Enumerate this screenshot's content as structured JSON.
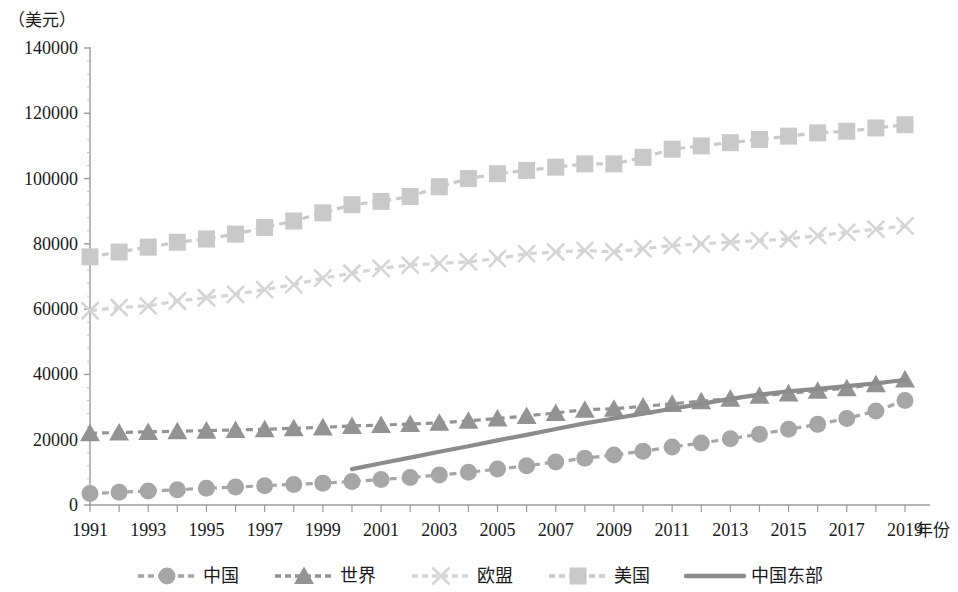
{
  "axis": {
    "y_unit_label": "（美元）",
    "x_axis_title": "年份",
    "y_ticks": [
      "0",
      "20000",
      "40000",
      "60000",
      "80000",
      "100000",
      "120000",
      "140000"
    ],
    "x_ticks": [
      "1991",
      "1993",
      "1995",
      "1997",
      "1999",
      "2001",
      "2003",
      "2005",
      "2007",
      "2009",
      "2011",
      "2013",
      "2015",
      "2017",
      "2019"
    ]
  },
  "legend": {
    "items": [
      {
        "label": "中国",
        "marker": "circle-marker",
        "color": "#a6a6a6"
      },
      {
        "label": "世界",
        "marker": "triangle-marker",
        "color": "#939393"
      },
      {
        "label": "欧盟",
        "marker": "x-marker",
        "color": "#d4d4d4"
      },
      {
        "label": "美国",
        "marker": "square-marker",
        "color": "#c9c9c9"
      },
      {
        "label": "中国东部",
        "marker": "plain-line",
        "color": "#8c8c8c"
      }
    ]
  },
  "chart_data": {
    "type": "line",
    "title": "",
    "xlabel": "年份",
    "ylabel": "（美元）",
    "xlim": [
      1991,
      2019
    ],
    "ylim": [
      0,
      140000
    ],
    "ytick_step": 20000,
    "grid": false,
    "legend_position": "bottom",
    "x": [
      1991,
      1992,
      1993,
      1994,
      1995,
      1996,
      1997,
      1998,
      1999,
      2000,
      2001,
      2002,
      2003,
      2004,
      2005,
      2006,
      2007,
      2008,
      2009,
      2010,
      2011,
      2012,
      2013,
      2014,
      2015,
      2016,
      2017,
      2018,
      2019
    ],
    "series": [
      {
        "name": "美国",
        "marker": "square",
        "color": "#c9c9c9",
        "line_style": "dashed",
        "values": [
          76000,
          77500,
          79000,
          80500,
          81500,
          83000,
          85000,
          87000,
          89500,
          92000,
          93000,
          94500,
          97500,
          100000,
          101500,
          102500,
          103500,
          104500,
          104500,
          106500,
          109000,
          110000,
          111000,
          112000,
          113000,
          114000,
          114500,
          115500,
          116500
        ]
      },
      {
        "name": "欧盟",
        "marker": "x",
        "color": "#d4d4d4",
        "line_style": "dashed",
        "values": [
          59500,
          60500,
          61000,
          62500,
          63500,
          64500,
          66000,
          67500,
          69500,
          71000,
          72500,
          73500,
          74000,
          74500,
          75500,
          77000,
          77500,
          78000,
          77500,
          78500,
          79500,
          80000,
          80500,
          81000,
          81500,
          82500,
          83500,
          84500,
          85500
        ]
      },
      {
        "name": "世界",
        "marker": "triangle",
        "color": "#939393",
        "line_style": "dashed",
        "values": [
          22000,
          22200,
          22400,
          22600,
          22800,
          23000,
          23200,
          23500,
          23800,
          24200,
          24500,
          24800,
          25200,
          25800,
          26500,
          27300,
          28200,
          29200,
          29500,
          30200,
          31000,
          31800,
          32600,
          33500,
          34200,
          35000,
          35800,
          37000,
          38500
        ]
      },
      {
        "name": "中国",
        "marker": "circle",
        "color": "#a6a6a6",
        "line_style": "dashed",
        "values": [
          3500,
          3900,
          4300,
          4700,
          5100,
          5500,
          5900,
          6300,
          6700,
          7200,
          7800,
          8400,
          9200,
          10000,
          11000,
          12000,
          13200,
          14300,
          15300,
          16500,
          17800,
          19000,
          20300,
          21700,
          23200,
          24700,
          26500,
          28800,
          32000
        ]
      },
      {
        "name": "中国东部",
        "marker": "none",
        "color": "#8c8c8c",
        "line_style": "solid",
        "start_year": 2000,
        "values": [
          null,
          null,
          null,
          null,
          null,
          null,
          null,
          null,
          null,
          11000,
          12800,
          14500,
          16300,
          18000,
          19800,
          21500,
          23300,
          25000,
          26500,
          28000,
          29500,
          31000,
          32500,
          33800,
          34800,
          35600,
          36400,
          37300,
          38300
        ]
      }
    ]
  }
}
